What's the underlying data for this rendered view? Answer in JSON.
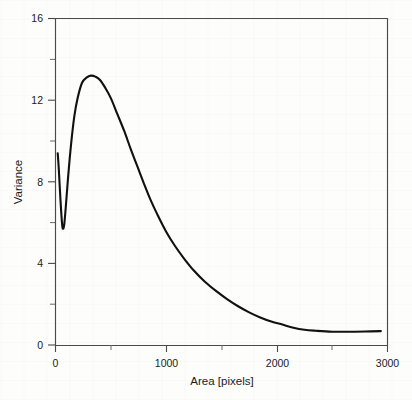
{
  "figure": {
    "background_color": "#fdfdfc",
    "ink_color": "#111111"
  },
  "chart_data": {
    "type": "line",
    "title": "",
    "subtitle": "",
    "xlabel": "Area [pixels]",
    "ylabel": "Variance",
    "xlim": [
      0,
      3000
    ],
    "ylim": [
      0,
      16
    ],
    "grid": false,
    "legend": null,
    "legend_position": "none",
    "x_major_ticks": [
      0,
      1000,
      2000,
      3000
    ],
    "x_major_tick_labels": [
      "0",
      "1000",
      "2000",
      "3000"
    ],
    "x_minor_ticks": [
      500,
      1500,
      2500
    ],
    "y_major_ticks": [
      0,
      4,
      8,
      12,
      16
    ],
    "y_major_tick_labels": [
      "0",
      "4",
      "8",
      "12",
      "16"
    ],
    "y_minor_ticks": [
      2,
      6,
      10,
      14
    ],
    "series": [
      {
        "name": "variance",
        "color": "#111111",
        "line_width": 2.1,
        "x": [
          20,
          30,
          45,
          60,
          70,
          80,
          95,
          115,
          140,
          170,
          200,
          240,
          280,
          320,
          360,
          400,
          450,
          500,
          560,
          620,
          680,
          740,
          800,
          860,
          920,
          1000,
          1080,
          1160,
          1250,
          1350,
          1450,
          1550,
          1650,
          1750,
          1850,
          1950,
          2050,
          2150,
          2250,
          2350,
          2500,
          2650,
          2800,
          2940
        ],
        "y": [
          9.4,
          8.6,
          7.1,
          5.9,
          5.7,
          5.95,
          6.9,
          8.3,
          9.8,
          11.2,
          12.1,
          12.85,
          13.1,
          13.2,
          13.15,
          13.0,
          12.6,
          12.1,
          11.3,
          10.5,
          9.6,
          8.75,
          7.9,
          7.1,
          6.4,
          5.55,
          4.85,
          4.25,
          3.65,
          3.1,
          2.65,
          2.25,
          1.9,
          1.6,
          1.35,
          1.15,
          1.0,
          0.85,
          0.75,
          0.7,
          0.65,
          0.65,
          0.66,
          0.68
        ]
      }
    ],
    "annotations": {
      "peak_x": 330,
      "peak_y": 13.2,
      "local_min_x": 70,
      "local_min_y": 5.7,
      "start_x": 20,
      "start_y": 9.4,
      "tail_level": 0.65
    }
  },
  "axes": {
    "x_title": "Area [pixels]",
    "y_title": "Variance"
  }
}
